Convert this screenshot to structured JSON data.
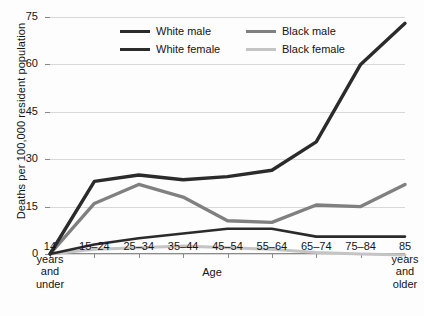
{
  "chart_data": {
    "type": "line",
    "title": "",
    "xlabel": "Age",
    "ylabel": "Deaths per 100,000 resident population",
    "ylim": [
      0,
      75
    ],
    "yticks": [
      0,
      15,
      30,
      45,
      60,
      75
    ],
    "grid": true,
    "legend_position": "top-center",
    "categories": [
      "14 years and under",
      "15–24",
      "25–34",
      "35–44",
      "45–54",
      "55–64",
      "65–74",
      "75–84",
      "85 years and older"
    ],
    "category_labels": [
      [
        "14",
        "years",
        "and",
        "under"
      ],
      [
        "15–24"
      ],
      [
        "25–34"
      ],
      [
        "35–44"
      ],
      [
        "45–54"
      ],
      [
        "55–64"
      ],
      [
        "65–74"
      ],
      [
        "75–84"
      ],
      [
        "85",
        "years",
        "and",
        "older"
      ]
    ],
    "series": [
      {
        "name": "White male",
        "color": "#2b2b2b",
        "width": 3.4,
        "values": [
          0,
          23,
          25,
          23.5,
          24.5,
          26.5,
          35.5,
          60,
          73
        ]
      },
      {
        "name": "White female",
        "color": "#2b2b2b",
        "width": 2.6,
        "values": [
          0,
          3,
          5,
          6.5,
          8,
          8,
          5.5,
          5.5,
          5.5
        ]
      },
      {
        "name": "Black male",
        "color": "#808080",
        "width": 3.4,
        "values": [
          0,
          16,
          22,
          18,
          10.5,
          10,
          15.5,
          15,
          22
        ]
      },
      {
        "name": "Black female",
        "color": "#c4c4c4",
        "width": 3.0,
        "values": [
          0,
          1.5,
          2,
          2.5,
          2,
          1.5,
          0.5,
          0,
          -0.3
        ]
      }
    ]
  },
  "axis": {
    "y_title": "Deaths per 100,000 resident population",
    "x_title": "Age"
  },
  "colors": {
    "white_male": "#2b2b2b",
    "white_female": "#2b2b2b",
    "black_male": "#808080",
    "black_female": "#c4c4c4",
    "grid": "#d8d8d8",
    "axis": "#8a8a8a",
    "text": "#141414",
    "background": "#fdfdfd"
  }
}
